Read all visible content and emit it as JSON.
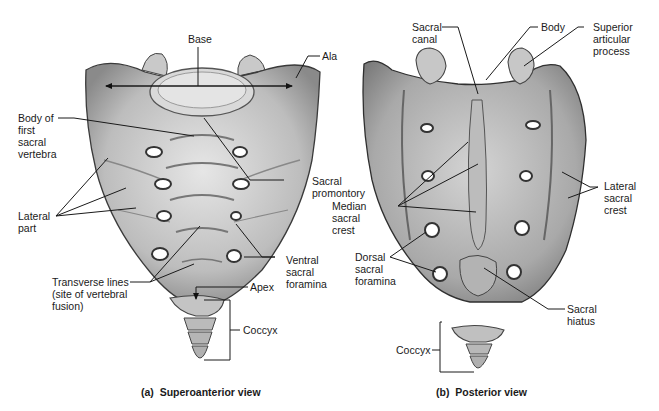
{
  "figure": {
    "panels": [
      {
        "id": "a",
        "caption": "(a)  Superoanterior view",
        "labels": {
          "base": "Base",
          "ala": "Ala",
          "body_first": "Body of\nfirst\nsacral\nvertebra",
          "sacral_promontory": "Sacral\npromontory",
          "lateral_part": "Lateral\npart",
          "ventral_foramina": "Ventral\nsacral\nforamina",
          "transverse_lines": "Transverse lines\n(site of vertebral\nfusion)",
          "apex": "Apex",
          "coccyx": "Coccyx"
        }
      },
      {
        "id": "b",
        "caption": "(b)  Posterior view",
        "labels": {
          "sacral_canal": "Sacral\ncanal",
          "body": "Body",
          "superior_articular": "Superior\narticular\nprocess",
          "median_crest": "Median\nsacral\ncrest",
          "lateral_crest": "Lateral\nsacral\ncrest",
          "dorsal_foramina": "Dorsal\nsacral\nforamina",
          "sacral_hiatus": "Sacral\nhiatus",
          "coccyx": "Coccyx"
        }
      }
    ],
    "colors": {
      "bone_fill": "#cfcfcf",
      "bone_shade": "#8f8f8f",
      "bone_outline": "#3a3a3a",
      "leader": "#1a1a1a",
      "foramen": "#ffffff"
    }
  }
}
